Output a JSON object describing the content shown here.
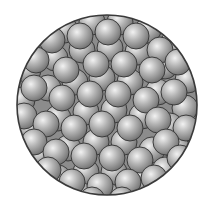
{
  "figure": {
    "container": {
      "cx": 107,
      "cy": 105,
      "r": 90,
      "stroke": "#3a3a3a",
      "fill": "#8c8c8c"
    },
    "sphere_colors": {
      "highlight": "#f2f2f2",
      "mid": "#b4b4b4",
      "shadow": "#6e6e6e",
      "outline": "#3c3c3c"
    },
    "back_spheres": [
      [
        40,
        40
      ],
      [
        65,
        30
      ],
      [
        92,
        22
      ],
      [
        120,
        22
      ],
      [
        148,
        30
      ],
      [
        172,
        45
      ],
      [
        28,
        70
      ],
      [
        55,
        58
      ],
      [
        82,
        50
      ],
      [
        110,
        48
      ],
      [
        138,
        52
      ],
      [
        165,
        66
      ],
      [
        188,
        80
      ],
      [
        22,
        100
      ],
      [
        48,
        88
      ],
      [
        75,
        82
      ],
      [
        102,
        78
      ],
      [
        130,
        82
      ],
      [
        158,
        92
      ],
      [
        185,
        108
      ],
      [
        30,
        128
      ],
      [
        58,
        118
      ],
      [
        86,
        112
      ],
      [
        114,
        110
      ],
      [
        142,
        116
      ],
      [
        170,
        126
      ],
      [
        40,
        155
      ],
      [
        68,
        148
      ],
      [
        96,
        142
      ],
      [
        124,
        142
      ],
      [
        152,
        150
      ],
      [
        178,
        150
      ],
      [
        58,
        178
      ],
      [
        86,
        172
      ],
      [
        114,
        172
      ],
      [
        142,
        176
      ],
      [
        165,
        170
      ],
      [
        80,
        195
      ],
      [
        108,
        196
      ],
      [
        135,
        192
      ]
    ],
    "front_spheres": [
      [
        52,
        40
      ],
      [
        80,
        36
      ],
      [
        108,
        32
      ],
      [
        136,
        36
      ],
      [
        160,
        50
      ],
      [
        36,
        60
      ],
      [
        66,
        70
      ],
      [
        96,
        64
      ],
      [
        124,
        64
      ],
      [
        152,
        70
      ],
      [
        178,
        62
      ],
      [
        34,
        88
      ],
      [
        62,
        98
      ],
      [
        90,
        94
      ],
      [
        118,
        94
      ],
      [
        146,
        100
      ],
      [
        174,
        92
      ],
      [
        24,
        116
      ],
      [
        46,
        124
      ],
      [
        74,
        128
      ],
      [
        102,
        124
      ],
      [
        130,
        128
      ],
      [
        158,
        120
      ],
      [
        186,
        128
      ],
      [
        34,
        142
      ],
      [
        56,
        152
      ],
      [
        84,
        156
      ],
      [
        112,
        158
      ],
      [
        140,
        160
      ],
      [
        166,
        142
      ],
      [
        48,
        170
      ],
      [
        72,
        182
      ],
      [
        100,
        186
      ],
      [
        128,
        182
      ],
      [
        154,
        178
      ],
      [
        180,
        158
      ],
      [
        92,
        200
      ],
      [
        122,
        200
      ]
    ],
    "sphere_radius": 13
  }
}
